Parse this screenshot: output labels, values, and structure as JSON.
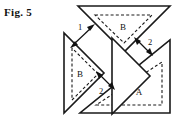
{
  "figure": {
    "label": "Fig. 5",
    "caption_number": "5",
    "background_color": "#ffffff",
    "line_color": "#1a1a1a",
    "width": 182,
    "height": 129
  },
  "pieces": [
    {
      "id": "top-triangle",
      "name": "top-right-triangle",
      "style": "solid",
      "inner_label": "B",
      "inner_style": "dashed",
      "points": "78,6 170,6 124,52",
      "inner_points": "95,15 152,15 124,43",
      "label_x": 123,
      "label_y": 27
    },
    {
      "id": "left-triangle",
      "name": "left-right-triangle",
      "style": "solid",
      "inner_label": "B",
      "inner_style": "dashed",
      "points": "64,33 64,113 104,73",
      "inner_points": "72,48 72,100 98,74",
      "label_x": 80,
      "label_y": 77
    },
    {
      "id": "bottom-right-triangle",
      "name": "bottom-right-triangle",
      "style": "solid",
      "inner_label": "A",
      "inner_style": "dashed",
      "points": "80,113 170,113 170,40",
      "inner_points": "96,105 162,105 162,62",
      "label_x": 139,
      "label_y": 92
    },
    {
      "id": "center-wedge",
      "name": "center-notch-wedge",
      "style": "solid",
      "inner_label": "",
      "points": "110,40 148,78 110,116",
      "label_x": 0,
      "label_y": 0
    }
  ],
  "dimensions": [
    {
      "id": "dim-1",
      "name": "dimension-1",
      "label": "1",
      "label_x": 80,
      "label_y": 31,
      "from_x": 72,
      "from_y": 44,
      "to_x": 93,
      "to_y": 26
    },
    {
      "id": "dim-2-right",
      "name": "dimension-2-right",
      "label": "2",
      "label_x": 148,
      "label_y": 44,
      "from_x": 135,
      "from_y": 38,
      "to_x": 150,
      "to_y": 55
    },
    {
      "id": "dim-2-bottom",
      "name": "dimension-2-bottom",
      "label": "2",
      "label_x": 101,
      "label_y": 92,
      "from_x": 97,
      "from_y": 73,
      "to_x": 113,
      "to_y": 88
    }
  ],
  "labels": {
    "piece_a": "A",
    "piece_b": "B",
    "gap_one": "1",
    "gap_two": "2"
  }
}
